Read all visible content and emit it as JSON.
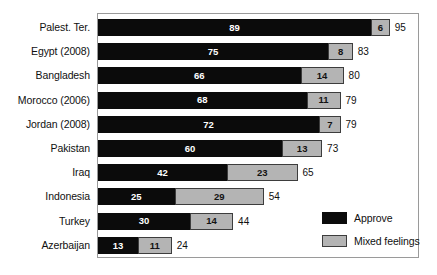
{
  "chart_data": {
    "type": "bar",
    "subtype": "stacked-horizontal",
    "title": "",
    "subtitle": "",
    "xlabel": "",
    "ylabel": "",
    "xlim": [
      0,
      100
    ],
    "grid": false,
    "legend_position": "bottom-right",
    "categories": [
      "Palest. Ter.",
      "Egypt (2008)",
      "Bangladesh",
      "Morocco (2006)",
      "Jordan (2008)",
      "Pakistan",
      "Iraq",
      "Indonesia",
      "Turkey",
      "Azerbaijan"
    ],
    "series": [
      {
        "name": "Approve",
        "color": "#0b0b0b",
        "values": [
          89,
          75,
          66,
          68,
          72,
          60,
          42,
          25,
          30,
          13
        ]
      },
      {
        "name": "Mixed feelings",
        "color": "#b4b4b4",
        "values": [
          6,
          8,
          14,
          11,
          7,
          13,
          23,
          29,
          14,
          11
        ]
      }
    ],
    "totals": [
      95,
      83,
      80,
      79,
      79,
      73,
      65,
      54,
      44,
      24
    ],
    "rows": [
      {
        "label": "Palest. Ter.",
        "approve": 89,
        "mixed": 6,
        "total": 95
      },
      {
        "label": "Egypt (2008)",
        "approve": 75,
        "mixed": 8,
        "total": 83
      },
      {
        "label": "Bangladesh",
        "approve": 66,
        "mixed": 14,
        "total": 80
      },
      {
        "label": "Morocco (2006)",
        "approve": 68,
        "mixed": 11,
        "total": 79
      },
      {
        "label": "Jordan (2008)",
        "approve": 72,
        "mixed": 7,
        "total": 79
      },
      {
        "label": "Pakistan",
        "approve": 60,
        "mixed": 13,
        "total": 73
      },
      {
        "label": "Iraq",
        "approve": 42,
        "mixed": 23,
        "total": 65
      },
      {
        "label": "Indonesia",
        "approve": 25,
        "mixed": 29,
        "total": 54
      },
      {
        "label": "Turkey",
        "approve": 30,
        "mixed": 14,
        "total": 44
      },
      {
        "label": "Azerbaijan",
        "approve": 13,
        "mixed": 11,
        "total": 24
      }
    ],
    "legend": [
      {
        "label": "Approve",
        "color": "#0b0b0b"
      },
      {
        "label": "Mixed feelings",
        "color": "#b4b4b4"
      }
    ]
  },
  "style": {
    "background": "#ffffff",
    "frame_color": "#9a9a9a",
    "approve_color": "#0b0b0b",
    "mixed_color": "#b4b4b4",
    "mixed_border": "#3d3d3d",
    "text_color": "#101010"
  }
}
